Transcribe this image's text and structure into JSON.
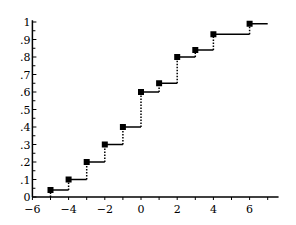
{
  "chart_data": {
    "type": "line",
    "subtype": "step-cdf",
    "title": "",
    "xlabel": "",
    "ylabel": "",
    "xlim": [
      -6,
      7.5
    ],
    "ylim": [
      0,
      1
    ],
    "grid": false,
    "legend": null,
    "x_ticks": [
      -6,
      -4,
      -2,
      0,
      2,
      4,
      6
    ],
    "x_tick_labels": [
      "−6",
      "−4",
      "−2",
      "0",
      "2",
      "4",
      "6"
    ],
    "y_ticks": [
      0,
      0.1,
      0.2,
      0.3,
      0.4,
      0.5,
      0.6,
      0.7,
      0.8,
      0.9,
      1
    ],
    "y_tick_labels": [
      "0",
      ".1",
      ".2",
      ".3",
      ".4",
      ".5",
      ".6",
      ".7",
      ".8",
      ".9",
      "1"
    ],
    "series": [
      {
        "name": "cumulative distribution",
        "points": [
          {
            "x": -5,
            "y": 0.04
          },
          {
            "x": -4,
            "y": 0.1
          },
          {
            "x": -3,
            "y": 0.2
          },
          {
            "x": -2,
            "y": 0.3
          },
          {
            "x": -1,
            "y": 0.4
          },
          {
            "x": 0,
            "y": 0.6
          },
          {
            "x": 1,
            "y": 0.65
          },
          {
            "x": 2,
            "y": 0.8
          },
          {
            "x": 3,
            "y": 0.84
          },
          {
            "x": 4,
            "y": 0.93
          },
          {
            "x": 6,
            "y": 0.99
          }
        ],
        "end_x": 7.0,
        "color": "#000000"
      }
    ]
  },
  "colors": {
    "line": "#000000",
    "background": "#ffffff"
  }
}
